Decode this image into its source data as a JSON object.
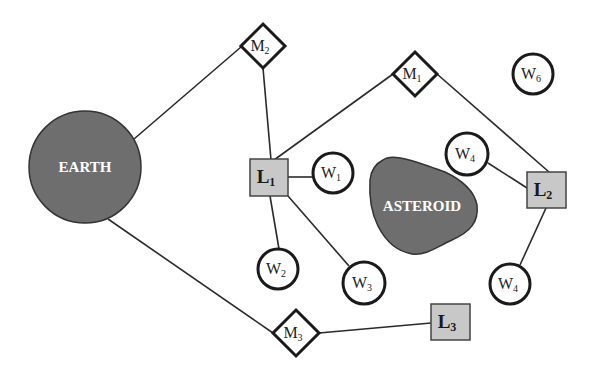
{
  "diagram": {
    "colors": {
      "background": "#ffffff",
      "body_fill": "#6e6e6e",
      "body_stroke": "#333333",
      "lander_fill": "#c8c8c8",
      "lander_stroke": "#444444",
      "node_stroke": "#1a1a1a",
      "edge": "#2a2a2a"
    },
    "bodies": {
      "earth": {
        "label": "EARTH",
        "cx": 85,
        "cy": 167,
        "r": 56
      },
      "asteroid": {
        "label": "ASTEROID"
      }
    },
    "motherships": [
      {
        "id": "M1",
        "base": "M",
        "sub": "1",
        "cx": 415,
        "cy": 74
      },
      {
        "id": "M2",
        "base": "M",
        "sub": "2",
        "cx": 263,
        "cy": 46
      },
      {
        "id": "M3",
        "base": "M",
        "sub": "3",
        "cx": 296,
        "cy": 333
      }
    ],
    "landers": [
      {
        "id": "L1",
        "base": "L",
        "sub": "1",
        "x": 250,
        "y": 159
      },
      {
        "id": "L2",
        "base": "L",
        "sub": "2",
        "x": 527,
        "y": 172
      },
      {
        "id": "L3",
        "base": "L",
        "sub": "3",
        "x": 431,
        "y": 304
      }
    ],
    "workers": [
      {
        "id": "W1",
        "base": "W",
        "sub": "1",
        "cx": 333,
        "cy": 173
      },
      {
        "id": "W2",
        "base": "W",
        "sub": "2",
        "cx": 278,
        "cy": 269
      },
      {
        "id": "W3",
        "base": "W",
        "sub": "3",
        "cx": 364,
        "cy": 283
      },
      {
        "id": "W4a",
        "base": "W",
        "sub": "4",
        "cx": 467,
        "cy": 154
      },
      {
        "id": "W4b",
        "base": "W",
        "sub": "4",
        "cx": 510,
        "cy": 284
      },
      {
        "id": "W6",
        "base": "W",
        "sub": "6",
        "cx": 533,
        "cy": 74
      }
    ],
    "edges": [
      {
        "from": "EARTH",
        "to": "M2"
      },
      {
        "from": "EARTH",
        "to": "M3"
      },
      {
        "from": "M2",
        "to": "L1"
      },
      {
        "from": "M1",
        "to": "L1"
      },
      {
        "from": "M1",
        "to": "L2"
      },
      {
        "from": "M3",
        "to": "L3"
      },
      {
        "from": "L1",
        "to": "W1"
      },
      {
        "from": "L1",
        "to": "W2"
      },
      {
        "from": "L1",
        "to": "W3"
      },
      {
        "from": "L2",
        "to": "W4a"
      },
      {
        "from": "L2",
        "to": "W4b"
      }
    ]
  }
}
